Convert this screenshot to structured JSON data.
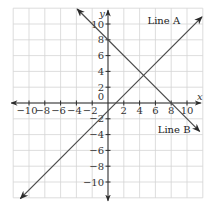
{
  "chart_data": {
    "type": "line",
    "title": "",
    "xlabel": "x",
    "ylabel": "y",
    "xlim": [
      -12,
      12
    ],
    "ylim": [
      -12,
      12
    ],
    "grid": true,
    "grid_step": 2,
    "x_ticks": [
      -10,
      -8,
      -6,
      -4,
      -2,
      2,
      4,
      6,
      8,
      10
    ],
    "y_ticks": [
      10,
      8,
      6,
      4,
      2,
      -2,
      -4,
      -6,
      -8,
      -10
    ],
    "x_tick_labels": [
      "−10",
      "−8",
      "−6",
      "−4",
      "−2",
      "2",
      "4",
      "6",
      "8",
      "10"
    ],
    "y_tick_labels": [
      "10",
      "8",
      "6",
      "4",
      "2",
      "−2",
      "−4",
      "−6",
      "−8",
      "−10"
    ],
    "origin_label": "0",
    "series": [
      {
        "name": "Line A",
        "equation": "y = x - 1",
        "x": [
          -11.1,
          11.9
        ],
        "y": [
          -12.1,
          10.9
        ],
        "slope": 1,
        "intercept": -1
      },
      {
        "name": "Line B",
        "equation": "y = -x + 8",
        "x": [
          -3.9,
          11.6
        ],
        "y": [
          11.9,
          -3.6
        ],
        "slope": -1,
        "intercept": 8
      }
    ],
    "annotations": [
      {
        "text": "Line A",
        "near_series": "Line A",
        "position": "top-right"
      },
      {
        "text": "Line B",
        "near_series": "Line B",
        "position": "right"
      }
    ],
    "intersection": {
      "x": 4.5,
      "y": 3.5
    }
  }
}
